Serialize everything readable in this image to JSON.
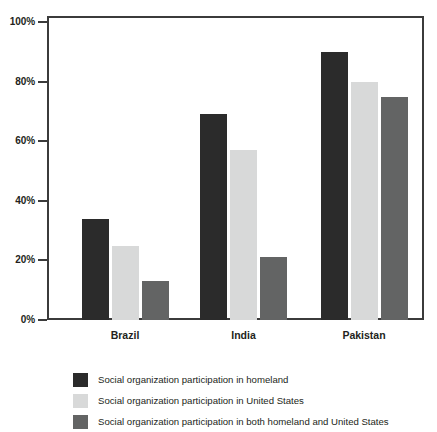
{
  "chart_data": {
    "type": "bar",
    "title": "",
    "subtitle": "",
    "xlabel": "",
    "ylabel": "",
    "ylim": [
      0,
      100
    ],
    "ytick_labels": [
      "0%",
      "20%",
      "40%",
      "60%",
      "80%",
      "100%"
    ],
    "ytick_values": [
      0,
      20,
      40,
      60,
      80,
      100
    ],
    "grid": false,
    "legend_position": "bottom-left",
    "value_suffix": "%",
    "categories": [
      "Brazil",
      "India",
      "Pakistan"
    ],
    "series": [
      {
        "name": "Social organization participation in homeland",
        "color": "#2b2b2b",
        "values": [
          34,
          69,
          90
        ]
      },
      {
        "name": "Social organization participation in United States",
        "color": "#d8d9d9",
        "values": [
          25,
          57,
          80
        ]
      },
      {
        "name": "Social organization participation in both homeland and United States",
        "color": "#636464",
        "values": [
          13,
          21,
          75
        ]
      }
    ]
  },
  "colors": {
    "axis": "#3b3b3b",
    "text": "#231f20",
    "background": "#ffffff",
    "series_1": "#2b2b2b",
    "series_2": "#d8d9d9",
    "series_3": "#636464"
  }
}
